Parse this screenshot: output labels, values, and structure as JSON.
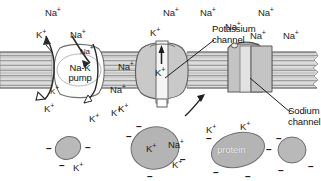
{
  "figure": {
    "type": "biology-diagram",
    "width": 321,
    "height": 181,
    "background": "#ffffff"
  },
  "colors": {
    "membrane_fill": "#d9d9d9",
    "membrane_line": "#8f8f8f",
    "protein_fill": "#b3b3b3",
    "protein_stroke": "#6e6e6e",
    "channel_fill": "#c6c6c6",
    "pore_fill": "#eaeaea",
    "ink": "#1d1d1d",
    "white": "#ffffff"
  },
  "structures": {
    "membrane": {
      "name": "plasma-membrane",
      "note": "lipid bilayer drawn as horizontal striped band"
    },
    "na_k_pump": {
      "name": "sodium-potassium-pump",
      "label_line1": "Na-K",
      "label_line2": "pump"
    },
    "potassium_channel": {
      "name": "potassium-channel",
      "label_line1": "Potassium",
      "label_line2": "channel"
    },
    "sodium_channel": {
      "name": "sodium-channel",
      "label_line1": "Sodium",
      "label_line2": "channel"
    }
  },
  "channel_ions": {
    "k_channel_top": "K",
    "k_channel_pore": "K",
    "k_channel_bottom": "K"
  },
  "pump_ions": {
    "k_in": "K",
    "na_out": "Na",
    "na_pore": "Na",
    "k_bottom": "K"
  },
  "extracellular_ions": [
    {
      "id": "na-ext-1",
      "text": "Na",
      "charge": "+",
      "x": 45,
      "y": 8
    },
    {
      "id": "k-ext-1",
      "text": "K",
      "charge": "+",
      "x": 36,
      "y": 30
    },
    {
      "id": "na-ext-2",
      "text": "Na",
      "charge": "+",
      "x": 70,
      "y": 30
    },
    {
      "id": "na-ext-3",
      "text": "Na",
      "charge": "+",
      "x": 118,
      "y": 62
    },
    {
      "id": "na-ext-4",
      "text": "Na",
      "charge": "+",
      "x": 110,
      "y": 85
    },
    {
      "id": "na-ext-5",
      "text": "Na",
      "charge": "+",
      "x": 163,
      "y": 8
    },
    {
      "id": "na-ext-6",
      "text": "Na",
      "charge": "+",
      "x": 200,
      "y": 8
    },
    {
      "id": "na-ext-7",
      "text": "Na",
      "charge": "+",
      "x": 225,
      "y": 22
    },
    {
      "id": "na-ext-8",
      "text": "Na",
      "charge": "+",
      "x": 258,
      "y": 8
    },
    {
      "id": "na-ext-9",
      "text": "Na",
      "charge": "+",
      "x": 250,
      "y": 31
    },
    {
      "id": "na-ext-10",
      "text": "Na",
      "charge": "+",
      "x": 283,
      "y": 31
    }
  ],
  "intracellular_ions": [
    {
      "id": "k-int-1",
      "text": "K",
      "charge": "+",
      "x": 44,
      "y": 104
    },
    {
      "id": "k-int-2",
      "text": "K",
      "charge": "+",
      "x": 89,
      "y": 114
    },
    {
      "id": "k-int-3",
      "text": "K",
      "charge": "+",
      "x": 118,
      "y": 104
    },
    {
      "id": "k-int-4",
      "text": "K",
      "charge": "+",
      "x": 73,
      "y": 163
    },
    {
      "id": "k-int-5",
      "text": "K",
      "charge": "+",
      "x": 111,
      "y": 108
    },
    {
      "id": "k-int-6",
      "text": "K",
      "charge": "+",
      "x": 146,
      "y": 144
    },
    {
      "id": "na-int-1",
      "text": "Na",
      "charge": "+",
      "x": 168,
      "y": 140
    },
    {
      "id": "k-int-7",
      "text": "K",
      "charge": "+",
      "x": 172,
      "y": 160
    },
    {
      "id": "k-int-8",
      "text": "K",
      "charge": "+",
      "x": 206,
      "y": 125
    },
    {
      "id": "k-int-9",
      "text": "K",
      "charge": "+",
      "x": 240,
      "y": 122
    }
  ],
  "cytoplasm_proteins": [
    {
      "id": "protein-small-1",
      "label": "",
      "cx": 68,
      "cy": 148,
      "rx": 13,
      "ry": 11,
      "rot": -25
    },
    {
      "id": "protein-large-1",
      "label": "",
      "cx": 155,
      "cy": 148,
      "rx": 24,
      "ry": 21,
      "rot": -10
    },
    {
      "id": "protein-labeled",
      "label": "protein",
      "cx": 238,
      "cy": 150,
      "rx": 26,
      "ry": 16,
      "rot": -14
    },
    {
      "id": "protein-small-2",
      "label": "",
      "cx": 292,
      "cy": 150,
      "rx": 14,
      "ry": 13,
      "rot": 0
    }
  ],
  "negative_charges": [
    {
      "x": 46,
      "y": 144
    },
    {
      "x": 85,
      "y": 143
    },
    {
      "x": 59,
      "y": 161
    },
    {
      "x": 126,
      "y": 132
    },
    {
      "x": 180,
      "y": 155
    },
    {
      "x": 147,
      "y": 172
    },
    {
      "x": 136,
      "y": 122
    },
    {
      "x": 206,
      "y": 134
    },
    {
      "x": 266,
      "y": 145
    },
    {
      "x": 213,
      "y": 168
    },
    {
      "x": 245,
      "y": 172
    },
    {
      "x": 276,
      "y": 134
    },
    {
      "x": 278,
      "y": 166
    },
    {
      "x": 308,
      "y": 162
    }
  ]
}
